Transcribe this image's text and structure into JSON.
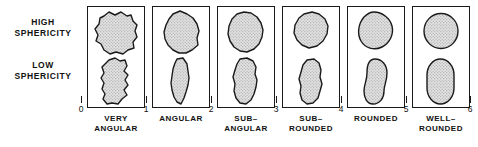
{
  "figure": {
    "row_labels": [
      {
        "id": "high-sphericity",
        "line1": "HIGH",
        "line2": "SPHERICITY"
      },
      {
        "id": "low-sphericity",
        "line1": "LOW",
        "line2": "SPHERICITY"
      }
    ],
    "scale_ticks": [
      "0",
      "1",
      "2",
      "3",
      "4",
      "5",
      "6"
    ],
    "classes": [
      {
        "id": "very-angular",
        "line1": "VERY",
        "line2": "ANGULAR",
        "rho_min": "0",
        "rho_max": "1"
      },
      {
        "id": "angular",
        "line1": "ANGULAR",
        "line2": "",
        "rho_min": "1",
        "rho_max": "2"
      },
      {
        "id": "sub-angular",
        "line1": "SUB–",
        "line2": "ANGULAR",
        "rho_min": "2",
        "rho_max": "3"
      },
      {
        "id": "sub-rounded",
        "line1": "SUB–",
        "line2": "ROUNDED",
        "rho_min": "3",
        "rho_max": "4"
      },
      {
        "id": "rounded",
        "line1": "ROUNDED",
        "line2": "",
        "rho_min": "4",
        "rho_max": "5"
      },
      {
        "id": "well-rounded",
        "line1": "WELL–",
        "line2": "ROUNDED",
        "rho_min": "5",
        "rho_max": "6"
      }
    ],
    "colors": {
      "outline": "#1a1a1a",
      "grain_fill": "#d9d9d9",
      "grain_stipple": "#8a8a8a",
      "background": "#ffffff",
      "text": "#111111"
    }
  }
}
